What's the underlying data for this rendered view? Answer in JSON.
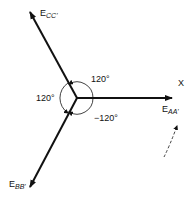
{
  "diagram": {
    "type": "three-phase phasor diagram",
    "phasors": [
      {
        "id": "aa",
        "main": "E",
        "sub": "AA'",
        "angle_deg": 0
      },
      {
        "id": "cc",
        "main": "E",
        "sub": "CC'",
        "angle_deg": 120
      },
      {
        "id": "bb",
        "main": "E",
        "sub": "BB'",
        "angle_deg": -120
      }
    ],
    "angle_labels": {
      "upper": "120°",
      "left": "120°",
      "lower": "−120°"
    },
    "axis_label": "X",
    "rotation_indicator": "dashed-arrow-counterclockwise"
  }
}
